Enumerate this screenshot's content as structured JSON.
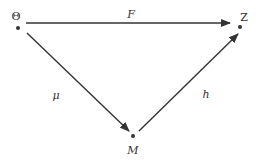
{
  "diagram": {
    "type": "commutative-triangle",
    "colors": {
      "line": "#333333",
      "text": "#333333",
      "background": "#ffffff"
    },
    "nodes": [
      {
        "id": "theta",
        "label": "Θ",
        "x": 18,
        "y": 28
      },
      {
        "id": "z",
        "label": "Z",
        "x": 240,
        "y": 27
      },
      {
        "id": "m",
        "label": "M",
        "x": 133,
        "y": 136
      }
    ],
    "edges": [
      {
        "id": "F",
        "from": "theta",
        "to": "z",
        "label": "F"
      },
      {
        "id": "mu",
        "from": "theta",
        "to": "m",
        "label": "μ"
      },
      {
        "id": "h",
        "from": "m",
        "to": "z",
        "label": "h"
      }
    ]
  },
  "labels": {
    "theta": "Θ",
    "z": "Z",
    "m": "M",
    "F": "F",
    "mu": "μ",
    "h": "h"
  }
}
